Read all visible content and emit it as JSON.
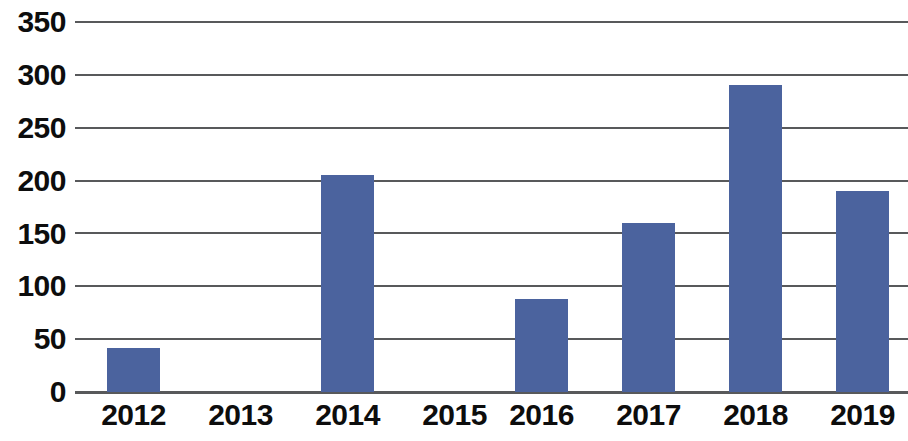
{
  "chart_data": {
    "type": "bar",
    "title": "",
    "subtitle": "",
    "xlabel": "",
    "ylabel": "",
    "categories": [
      "2012",
      "2013",
      "2014",
      "2015",
      "2016",
      "2017",
      "2018",
      "2019"
    ],
    "values": [
      42,
      0,
      205,
      0,
      88,
      160,
      290,
      190
    ],
    "series": [
      {
        "name": "",
        "values": [
          42,
          0,
          205,
          0,
          88,
          160,
          290,
          190
        ]
      }
    ],
    "ylim": [
      0,
      350
    ],
    "y_ticks": [
      0,
      50,
      100,
      150,
      200,
      250,
      300,
      350
    ],
    "y_tick_labels": [
      "0",
      "50",
      "100",
      "150",
      "200",
      "250",
      "300",
      "350"
    ],
    "grid": true,
    "grid_axis": "y",
    "legend": false,
    "legend_position": "none",
    "annotations": [],
    "colors": {
      "bar": "#4b639e",
      "gridline": "#58595b",
      "axis_text": "#0d0d0d",
      "background": "#ffffff"
    }
  }
}
